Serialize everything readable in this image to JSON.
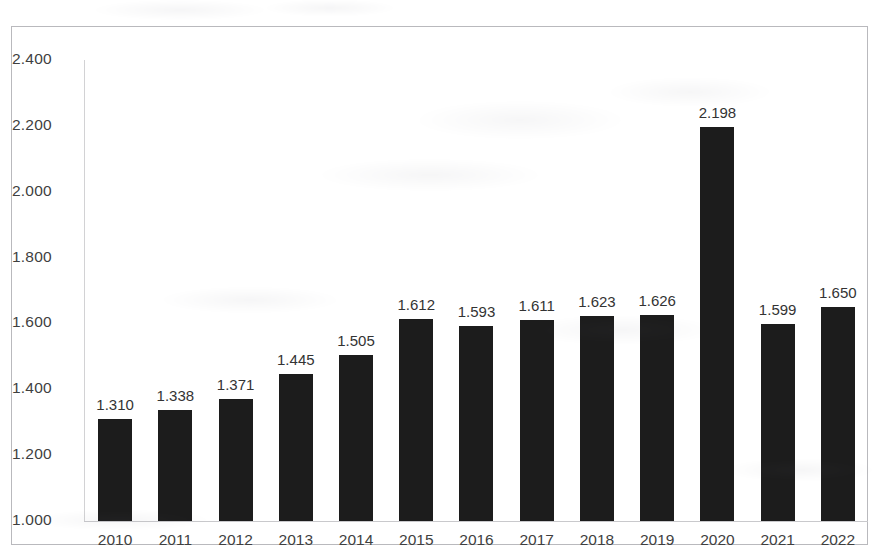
{
  "chart_data": {
    "type": "bar",
    "title": "",
    "subtitle": "",
    "xlabel": "",
    "ylabel": "",
    "categories": [
      "2010",
      "2011",
      "2012",
      "2013",
      "2014",
      "2015",
      "2016",
      "2017",
      "2018",
      "2019",
      "2020",
      "2021",
      "2022"
    ],
    "values": [
      1310,
      1338,
      1371,
      1445,
      1505,
      1612,
      1593,
      1611,
      1623,
      1626,
      2198,
      1599,
      1650
    ],
    "value_labels": [
      "1.310",
      "1.338",
      "1.371",
      "1.445",
      "1.505",
      "1.612",
      "1.593",
      "1.611",
      "1.623",
      "1.626",
      "2.198",
      "1.599",
      "1.650"
    ],
    "ylim": [
      1000,
      2400
    ],
    "ytick_labels": [
      "2.400",
      "2.200",
      "2.000",
      "1.800",
      "1.600",
      "1.400",
      "1.200",
      "1.000"
    ],
    "ytick_values": [
      2400,
      2200,
      2000,
      1800,
      1600,
      1400,
      1200,
      1000
    ],
    "ytick_step": 200,
    "grid": false,
    "legend": "none",
    "bar_color": "#1c1c1c",
    "axis_color": "#c9c9cc",
    "frame_border_color": "#b9b9bd",
    "background_color": "#ffffff",
    "number_format": "decimal-point-as-thousands-separator",
    "series": [
      {
        "name": "",
        "values": [
          1310,
          1338,
          1371,
          1445,
          1505,
          1612,
          1593,
          1611,
          1623,
          1626,
          2198,
          1599,
          1650
        ]
      }
    ]
  }
}
